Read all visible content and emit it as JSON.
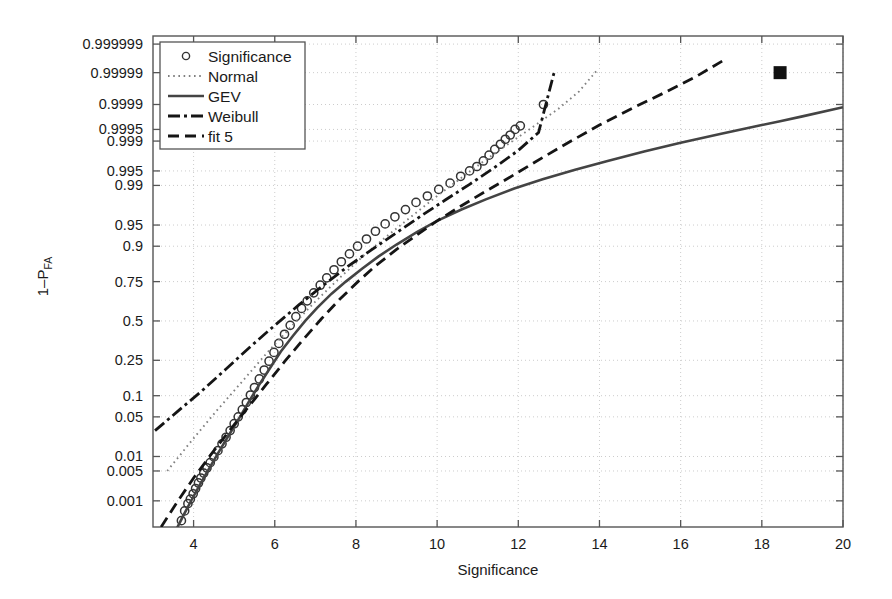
{
  "chart_data": {
    "type": "line",
    "title": "",
    "xlabel": "Significance",
    "ylabel": "1-P_FA",
    "ylabel_parts": {
      "main": "1–P",
      "subscript": "FA"
    },
    "xlim": [
      3,
      20
    ],
    "ylim_probability": [
      0.0002,
      0.9999995
    ],
    "grid": true,
    "grid_style": "dotted",
    "grid_color": "#cccccc",
    "background_color": "#ffffff",
    "axis_color": "#555555",
    "legend_position": "top-left",
    "xticks": [
      4,
      6,
      8,
      10,
      12,
      14,
      16,
      18,
      20
    ],
    "xtick_labels": [
      "4",
      "6",
      "8",
      "10",
      "12",
      "14",
      "16",
      "18",
      "20"
    ],
    "yticks": [
      0.999999,
      0.99999,
      0.9999,
      0.9995,
      0.999,
      0.995,
      0.99,
      0.95,
      0.9,
      0.75,
      0.5,
      0.25,
      0.1,
      0.05,
      0.01,
      0.005,
      0.001
    ],
    "ytick_labels": [
      "0.999999",
      "0.99999",
      "0.9999",
      "0.9995",
      "0.999",
      "0.995",
      "0.99",
      "0.95",
      "0.9",
      "0.75",
      "0.5",
      "0.25",
      "0.1",
      "0.05",
      "0.01",
      "0.005",
      "0.001"
    ],
    "y_scale": "normal-probability",
    "legend": [
      {
        "label": "Significance",
        "style": "marker-circle",
        "color": "#333333"
      },
      {
        "label": "Normal",
        "style": "dotted",
        "color": "#777777"
      },
      {
        "label": "GEV",
        "style": "solid",
        "color": "#444444"
      },
      {
        "label": "Weibull",
        "style": "dash-dot",
        "color": "#1a1a1a"
      },
      {
        "label": "fit 5",
        "style": "dashed",
        "color": "#1a1a1a"
      }
    ],
    "series": [
      {
        "name": "Significance",
        "style": "marker-circle",
        "points": [
          [
            3.7,
            0.0003
          ],
          [
            3.78,
            0.00055
          ],
          [
            3.86,
            0.00085
          ],
          [
            3.92,
            0.0011
          ],
          [
            3.99,
            0.0015
          ],
          [
            4.05,
            0.002
          ],
          [
            4.12,
            0.0027
          ],
          [
            4.18,
            0.0035
          ],
          [
            4.25,
            0.0045
          ],
          [
            4.33,
            0.0058
          ],
          [
            4.41,
            0.0075
          ],
          [
            4.5,
            0.0098
          ],
          [
            4.6,
            0.013
          ],
          [
            4.7,
            0.0175
          ],
          [
            4.8,
            0.023
          ],
          [
            4.9,
            0.03
          ],
          [
            5.0,
            0.039
          ],
          [
            5.1,
            0.05
          ],
          [
            5.2,
            0.064
          ],
          [
            5.3,
            0.081
          ],
          [
            5.4,
            0.102
          ],
          [
            5.5,
            0.127
          ],
          [
            5.62,
            0.16
          ],
          [
            5.74,
            0.2
          ],
          [
            5.86,
            0.245
          ],
          [
            5.98,
            0.295
          ],
          [
            6.1,
            0.35
          ],
          [
            6.24,
            0.41
          ],
          [
            6.38,
            0.47
          ],
          [
            6.52,
            0.53
          ],
          [
            6.66,
            0.585
          ],
          [
            6.8,
            0.635
          ],
          [
            6.96,
            0.685
          ],
          [
            7.12,
            0.73
          ],
          [
            7.28,
            0.77
          ],
          [
            7.46,
            0.81
          ],
          [
            7.64,
            0.845
          ],
          [
            7.84,
            0.875
          ],
          [
            8.04,
            0.9
          ],
          [
            8.26,
            0.92
          ],
          [
            8.48,
            0.938
          ],
          [
            8.72,
            0.952
          ],
          [
            8.96,
            0.963
          ],
          [
            9.22,
            0.972
          ],
          [
            9.48,
            0.979
          ],
          [
            9.76,
            0.984
          ],
          [
            10.04,
            0.988
          ],
          [
            10.32,
            0.991
          ],
          [
            10.58,
            0.9935
          ],
          [
            10.8,
            0.995
          ],
          [
            10.98,
            0.996
          ],
          [
            11.14,
            0.997
          ],
          [
            11.28,
            0.9978
          ],
          [
            11.42,
            0.9984
          ],
          [
            11.56,
            0.9988
          ],
          [
            11.68,
            0.9991
          ],
          [
            11.8,
            0.9993
          ],
          [
            11.92,
            0.9995
          ],
          [
            12.05,
            0.9996
          ],
          [
            12.62,
            0.9999
          ]
        ]
      },
      {
        "name": "Normal",
        "style": "dotted",
        "points": [
          [
            3.35,
            0.005
          ],
          [
            4.0,
            0.022
          ],
          [
            4.6,
            0.065
          ],
          [
            5.2,
            0.15
          ],
          [
            5.8,
            0.29
          ],
          [
            6.4,
            0.46
          ],
          [
            7.0,
            0.63
          ],
          [
            7.6,
            0.77
          ],
          [
            8.2,
            0.87
          ],
          [
            8.8,
            0.93
          ],
          [
            9.4,
            0.965
          ],
          [
            10.0,
            0.984
          ],
          [
            10.6,
            0.993
          ],
          [
            11.2,
            0.9972
          ],
          [
            11.8,
            0.9989
          ],
          [
            12.4,
            0.9996
          ],
          [
            13.0,
            0.99987
          ],
          [
            13.5,
            0.99996
          ],
          [
            13.95,
            0.999992
          ]
        ]
      },
      {
        "name": "GEV",
        "style": "solid",
        "points": [
          [
            3.55,
            0.00015
          ],
          [
            3.75,
            0.00042
          ],
          [
            3.95,
            0.00105
          ],
          [
            4.15,
            0.0024
          ],
          [
            4.35,
            0.005
          ],
          [
            4.55,
            0.0098
          ],
          [
            4.75,
            0.018
          ],
          [
            4.95,
            0.031
          ],
          [
            5.15,
            0.051
          ],
          [
            5.4,
            0.09
          ],
          [
            5.65,
            0.145
          ],
          [
            5.9,
            0.215
          ],
          [
            6.15,
            0.3
          ],
          [
            6.45,
            0.4
          ],
          [
            6.75,
            0.5
          ],
          [
            7.05,
            0.59
          ],
          [
            7.4,
            0.68
          ],
          [
            7.75,
            0.75
          ],
          [
            8.15,
            0.815
          ],
          [
            8.55,
            0.865
          ],
          [
            9.0,
            0.905
          ],
          [
            9.5,
            0.936
          ],
          [
            10.0,
            0.957
          ],
          [
            10.6,
            0.972
          ],
          [
            11.2,
            0.9815
          ],
          [
            11.9,
            0.9885
          ],
          [
            12.6,
            0.9925
          ],
          [
            13.4,
            0.9953
          ],
          [
            14.2,
            0.997
          ],
          [
            15.1,
            0.9982
          ],
          [
            16.0,
            0.9989
          ],
          [
            17.0,
            0.99935
          ],
          [
            18.0,
            0.99962
          ],
          [
            18.45,
            0.9997
          ],
          [
            19.0,
            0.99978
          ],
          [
            20.0,
            0.99988
          ]
        ]
      },
      {
        "name": "Weibull",
        "style": "dash-dot",
        "points": [
          [
            3.05,
            0.03
          ],
          [
            3.6,
            0.06
          ],
          [
            4.2,
            0.115
          ],
          [
            4.8,
            0.205
          ],
          [
            5.4,
            0.33
          ],
          [
            6.0,
            0.47
          ],
          [
            6.6,
            0.61
          ],
          [
            7.2,
            0.73
          ],
          [
            7.8,
            0.825
          ],
          [
            8.4,
            0.89
          ],
          [
            9.0,
            0.935
          ],
          [
            9.6,
            0.964
          ],
          [
            10.2,
            0.981
          ],
          [
            10.8,
            0.9905
          ],
          [
            11.4,
            0.9957
          ],
          [
            12.0,
            0.9983
          ],
          [
            12.5,
            0.9994
          ],
          [
            12.9,
            0.999992
          ]
        ]
      },
      {
        "name": "fit 5",
        "style": "dashed",
        "points": [
          [
            3.2,
            0.0002
          ],
          [
            3.6,
            0.00095
          ],
          [
            4.0,
            0.0035
          ],
          [
            4.45,
            0.0115
          ],
          [
            4.9,
            0.031
          ],
          [
            5.35,
            0.07
          ],
          [
            5.8,
            0.14
          ],
          [
            6.25,
            0.245
          ],
          [
            6.7,
            0.375
          ],
          [
            7.15,
            0.515
          ],
          [
            7.6,
            0.645
          ],
          [
            8.05,
            0.75
          ],
          [
            8.5,
            0.83
          ],
          [
            9.0,
            0.89
          ],
          [
            9.5,
            0.93
          ],
          [
            10.0,
            0.957
          ],
          [
            10.6,
            0.976
          ],
          [
            11.2,
            0.987
          ],
          [
            11.9,
            0.994
          ],
          [
            12.6,
            0.9975
          ],
          [
            13.3,
            0.999
          ],
          [
            14.0,
            0.99962
          ],
          [
            14.8,
            0.99987
          ],
          [
            15.6,
            0.999956
          ],
          [
            16.4,
            0.999987
          ],
          [
            17.1,
            0.9999965
          ]
        ]
      }
    ],
    "markers": [
      {
        "name": "operating-point",
        "x": 18.45,
        "y": 0.99999,
        "shape": "filled-square",
        "color": "#111111"
      }
    ]
  }
}
